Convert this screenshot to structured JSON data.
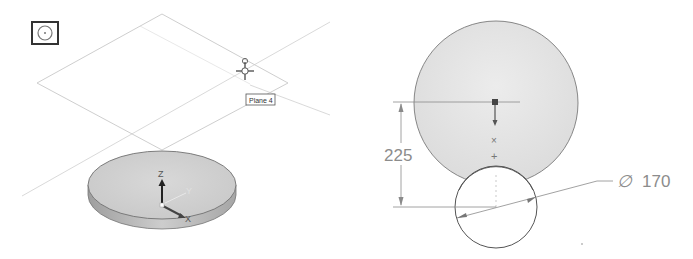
{
  "left_view": {
    "sketch_plane_icon": "sketch-on-plane-icon",
    "plane_tag": "Plane 4",
    "triad": {
      "z_label": "Z",
      "y_label": "Y",
      "x_label": "X"
    },
    "cursor_icon": "move-crosshair-icon"
  },
  "right_view": {
    "vertical_dimension": "225",
    "diameter_symbol": "∅",
    "diameter_value": "170"
  },
  "colors": {
    "part_face": "#d3d3d3",
    "part_side": "#b5b5b5",
    "sketch_fill": "#e3e3e3",
    "plane_line": "#c8c8c8",
    "dimension": "#8a8a8a"
  }
}
